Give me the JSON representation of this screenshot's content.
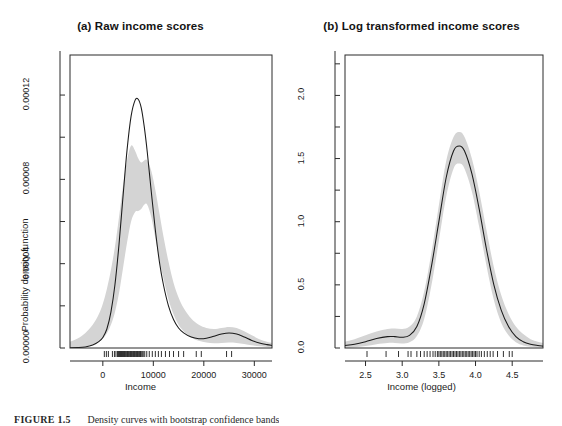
{
  "figure": {
    "caption_label": "FIGURE 1.5",
    "caption_text": "Density curves with bootstrap confidence bands",
    "background": "#ffffff",
    "line_color": "#1a1a1a",
    "band_color": "#d4d4d4",
    "axis_color": "#2b2b2b"
  },
  "chart_data": [
    {
      "type": "area",
      "panel_id": "a",
      "title": "(a) Raw income scores",
      "xlabel": "Income",
      "ylabel": "Probability density function",
      "xlim": [
        -6500,
        33500
      ],
      "ylim": [
        0,
        0.000139
      ],
      "xticks": [
        0,
        10000,
        20000,
        30000
      ],
      "xtick_labels": [
        "0",
        "10000",
        "20000",
        "30000"
      ],
      "yticks": [
        0.0,
        4e-05,
        8e-05,
        0.00012
      ],
      "ytick_labels": [
        "0.00000",
        "0.00004",
        "0.00008",
        "0.00012"
      ],
      "minor_yticks": [
        2e-05,
        6e-05,
        0.0001,
        0.00014
      ],
      "grid": false,
      "legend": "none",
      "series": [
        {
          "name": "density",
          "x": [
            -6500,
            -5000,
            -3500,
            -2000,
            -800,
            0,
            800,
            1600,
            2400,
            3200,
            4000,
            4800,
            5600,
            6400,
            7000,
            7600,
            8200,
            8800,
            9600,
            10400,
            11200,
            12000,
            13000,
            14000,
            15000,
            16000,
            17500,
            19000,
            20500,
            22000,
            23500,
            25000,
            26500,
            28000,
            29500,
            31000,
            32500,
            33500
          ],
          "values": [
            1e-07,
            2e-07,
            5e-07,
            1.4e-06,
            3e-06,
            5e-06,
            9e-06,
            1.7e-05,
            3e-05,
            4.9e-05,
            7.2e-05,
            9.4e-05,
            0.00011,
            0.0001176,
            0.000118,
            0.000114,
            0.000105,
            9.3e-05,
            7.4e-05,
            5.6e-05,
            4.1e-05,
            3e-05,
            2e-05,
            1.35e-05,
            9.5e-06,
            7.2e-06,
            5.2e-06,
            4.4e-06,
            4.6e-06,
            5.6e-06,
            6.6e-06,
            7.1e-06,
            6.6e-06,
            5.2e-06,
            3.6e-06,
            2.4e-06,
            1.6e-06,
            1.2e-06
          ]
        },
        {
          "name": "band_upper",
          "x": [
            -6500,
            -5000,
            -3500,
            -2000,
            -800,
            0,
            800,
            1600,
            2400,
            3200,
            4000,
            4800,
            5600,
            6400,
            7000,
            7600,
            8200,
            8800,
            9600,
            10400,
            11200,
            12000,
            13000,
            14000,
            15000,
            16000,
            17500,
            19000,
            20500,
            22000,
            23500,
            25000,
            26500,
            28000,
            29500,
            31000,
            32500,
            33500
          ],
          "values": [
            3e-06,
            4.5e-06,
            7e-06,
            1.1e-05,
            1.6e-05,
            2.1e-05,
            2.8e-05,
            3.7e-05,
            4.8e-05,
            6.2e-05,
            7.7e-05,
            8.9e-05,
            9.6e-05,
            9.35e-05,
            9e-05,
            8.8e-05,
            8.9e-05,
            8.9e-05,
            8.4e-05,
            7.5e-05,
            6.4e-05,
            5.3e-05,
            4.1e-05,
            3.1e-05,
            2.4e-05,
            1.9e-05,
            1.4e-05,
            1.1e-05,
            9.5e-06,
            9e-06,
            9.5e-06,
            1e-05,
            9.5e-06,
            8e-06,
            6e-06,
            4.2e-06,
            3e-06,
            2.4e-06
          ]
        },
        {
          "name": "band_lower",
          "x": [
            -6500,
            -5000,
            -3500,
            -2000,
            -800,
            0,
            800,
            1600,
            2400,
            3200,
            4000,
            4800,
            5600,
            6400,
            7000,
            7600,
            8200,
            8800,
            9600,
            10400,
            11200,
            12000,
            13000,
            14000,
            15000,
            16000,
            17500,
            19000,
            20500,
            22000,
            23500,
            25000,
            26500,
            28000,
            29500,
            31000,
            32500,
            33500
          ],
          "values": [
            0.0,
            2e-07,
            6e-07,
            1.5e-06,
            3e-06,
            4.5e-06,
            7e-06,
            1.1e-05,
            1.7e-05,
            2.6e-05,
            3.8e-05,
            5e-05,
            6e-05,
            6.45e-05,
            6.5e-05,
            6.6e-05,
            6.8e-05,
            6.8e-05,
            6.2e-05,
            5.2e-05,
            4.2e-05,
            3.3e-05,
            2.3e-05,
            1.6e-05,
            1.1e-05,
            8e-06,
            5e-06,
            3.4e-06,
            2.6e-06,
            2.3e-06,
            2.4e-06,
            2.6e-06,
            2.4e-06,
            1.9e-06,
            1.3e-06,
            8e-07,
            5e-07,
            3e-07
          ]
        }
      ],
      "rug_values": [
        300,
        700,
        1100,
        1900,
        2300,
        2600,
        2900,
        3100,
        3300,
        3500,
        3700,
        3900,
        4100,
        4300,
        4450,
        4600,
        4750,
        4900,
        5050,
        5200,
        5350,
        5500,
        5650,
        5800,
        5950,
        6100,
        6250,
        6400,
        6550,
        6700,
        6850,
        7000,
        7150,
        7300,
        7450,
        7600,
        7800,
        8000,
        8300,
        8700,
        9200,
        9800,
        10400,
        11000,
        11600,
        12400,
        13200,
        14000,
        15000,
        16000,
        18500,
        19500,
        24500,
        25500
      ]
    },
    {
      "type": "area",
      "panel_id": "b",
      "title": "(b) Log transformed income scores",
      "xlabel": "Income (logged)",
      "ylabel": "Probability density function",
      "xlim": [
        2.22,
        4.92
      ],
      "ylim": [
        0,
        2.32
      ],
      "xticks": [
        2.5,
        3.0,
        3.5,
        4.0,
        4.5
      ],
      "xtick_labels": [
        "2.5",
        "3.0",
        "3.5",
        "4.0",
        "4.5"
      ],
      "yticks": [
        0.0,
        0.5,
        1.0,
        1.5,
        2.0
      ],
      "ytick_labels": [
        "0.0",
        "0.5",
        "1.0",
        "1.5",
        "2.0"
      ],
      "minor_yticks": [
        0.25,
        0.75,
        1.25,
        1.75,
        2.25
      ],
      "grid": false,
      "legend": "none",
      "series": [
        {
          "name": "density",
          "x": [
            2.22,
            2.35,
            2.5,
            2.65,
            2.8,
            2.9,
            3.0,
            3.1,
            3.2,
            3.3,
            3.4,
            3.5,
            3.6,
            3.7,
            3.78,
            3.85,
            3.95,
            4.05,
            4.15,
            4.25,
            4.35,
            4.45,
            4.55,
            4.65,
            4.75,
            4.85,
            4.92
          ],
          "values": [
            0.02,
            0.03,
            0.05,
            0.075,
            0.09,
            0.09,
            0.085,
            0.1,
            0.17,
            0.35,
            0.65,
            1.0,
            1.35,
            1.56,
            1.6,
            1.56,
            1.38,
            1.1,
            0.78,
            0.5,
            0.3,
            0.17,
            0.09,
            0.05,
            0.03,
            0.02,
            0.015
          ]
        },
        {
          "name": "band_upper",
          "x": [
            2.22,
            2.35,
            2.5,
            2.65,
            2.8,
            2.9,
            3.0,
            3.1,
            3.2,
            3.3,
            3.4,
            3.5,
            3.6,
            3.7,
            3.78,
            3.85,
            3.95,
            4.05,
            4.15,
            4.25,
            4.35,
            4.45,
            4.55,
            4.65,
            4.75,
            4.85,
            4.92
          ],
          "values": [
            0.05,
            0.07,
            0.1,
            0.13,
            0.15,
            0.155,
            0.15,
            0.17,
            0.25,
            0.45,
            0.76,
            1.13,
            1.48,
            1.67,
            1.71,
            1.67,
            1.5,
            1.24,
            0.93,
            0.64,
            0.42,
            0.27,
            0.17,
            0.11,
            0.07,
            0.05,
            0.04
          ]
        },
        {
          "name": "band_lower",
          "x": [
            2.22,
            2.35,
            2.5,
            2.65,
            2.8,
            2.9,
            3.0,
            3.1,
            3.2,
            3.3,
            3.4,
            3.5,
            3.6,
            3.7,
            3.78,
            3.85,
            3.95,
            4.05,
            4.15,
            4.25,
            4.35,
            4.45,
            4.55,
            4.65,
            4.75,
            4.85,
            4.92
          ],
          "values": [
            0.0,
            0.005,
            0.015,
            0.03,
            0.04,
            0.04,
            0.035,
            0.045,
            0.095,
            0.23,
            0.5,
            0.85,
            1.2,
            1.42,
            1.46,
            1.42,
            1.24,
            0.96,
            0.65,
            0.38,
            0.2,
            0.1,
            0.045,
            0.02,
            0.01,
            0.005,
            0.003
          ]
        }
      ],
      "rug_values": [
        2.52,
        2.78,
        2.95,
        3.08,
        3.12,
        3.2,
        3.25,
        3.3,
        3.34,
        3.38,
        3.42,
        3.45,
        3.48,
        3.5,
        3.52,
        3.54,
        3.56,
        3.58,
        3.6,
        3.62,
        3.64,
        3.66,
        3.68,
        3.7,
        3.72,
        3.74,
        3.76,
        3.78,
        3.8,
        3.82,
        3.84,
        3.86,
        3.88,
        3.9,
        3.92,
        3.94,
        3.96,
        3.98,
        4.0,
        4.02,
        4.05,
        4.08,
        4.12,
        4.16,
        4.2,
        4.24,
        4.3,
        4.38,
        4.46,
        4.5
      ]
    }
  ]
}
